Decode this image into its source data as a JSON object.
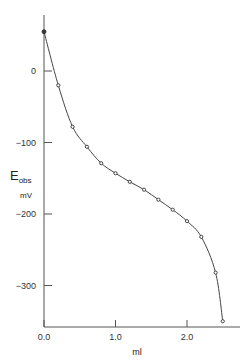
{
  "chart_data": {
    "type": "line",
    "title": "",
    "xlabel": "ml",
    "ylabel": "E_obs mV",
    "ylabel_main": "E",
    "ylabel_sub": "obs",
    "ylabel_unit": "mV",
    "xlim": [
      0.0,
      2.6
    ],
    "ylim": [
      -350,
      60
    ],
    "x_ticks": [
      "0.0",
      "1.0",
      "2.0"
    ],
    "y_ticks": [
      "0",
      "-100",
      "-200",
      "-300"
    ],
    "grid": false,
    "legend": null,
    "x": [
      0.0,
      0.2,
      0.4,
      0.6,
      0.8,
      1.0,
      1.2,
      1.4,
      1.6,
      1.8,
      2.0,
      2.2,
      2.4,
      2.5
    ],
    "series": [
      {
        "name": "E_obs",
        "values": [
          55,
          -20,
          -78,
          -106,
          -129,
          -143,
          -155,
          -166,
          -180,
          -194,
          -210,
          -232,
          -282,
          -350
        ]
      }
    ]
  }
}
